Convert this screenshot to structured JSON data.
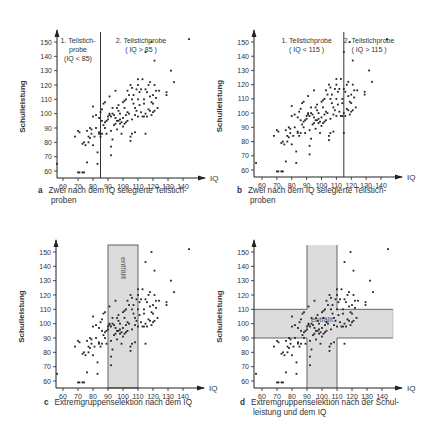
{
  "chart_data": [
    {
      "id": "a",
      "type": "scatter",
      "caption_letter": "a",
      "caption_line1": "Zwei nach dem IQ selegierte Teilstich-",
      "caption_line2": "proben",
      "xlabel": "IQ",
      "ylabel": "Schulleistung",
      "xticks": [
        60,
        70,
        80,
        90,
        100,
        110,
        120,
        130,
        140
      ],
      "yticks": [
        60,
        70,
        80,
        90,
        100,
        110,
        120,
        130,
        140,
        150
      ],
      "xlim": [
        55,
        145
      ],
      "ylim": [
        55,
        155
      ],
      "cut_x": 85,
      "annotations": [
        {
          "lines": [
            "1. Teilstich-",
            "probe",
            "(IQ < 85)"
          ],
          "iq": 70,
          "y": 149
        },
        {
          "lines": [
            "2. Teilstichprobe",
            "( IQ > 85 )"
          ],
          "iq": 112,
          "y": 149
        }
      ]
    },
    {
      "id": "b",
      "type": "scatter",
      "caption_letter": "b",
      "caption_line1": "Zwei nach dem IQ selegierte Teilstich-",
      "caption_line2": "proben",
      "xlabel": "IQ",
      "ylabel": "Schulleistung",
      "xticks": [
        60,
        70,
        80,
        90,
        100,
        110,
        120,
        130,
        140
      ],
      "yticks": [
        60,
        70,
        80,
        90,
        100,
        110,
        120,
        130,
        140,
        150
      ],
      "xlim": [
        55,
        145
      ],
      "ylim": [
        55,
        155
      ],
      "cut_x": 115,
      "annotations": [
        {
          "lines": [
            "1. Teilstichprobe",
            "( IQ < 115 )"
          ],
          "iq": 90,
          "y": 149
        },
        {
          "lines": [
            "2. Teilstichprobe",
            "( IQ > 115 )"
          ],
          "iq": 132,
          "y": 149
        }
      ]
    },
    {
      "id": "c",
      "type": "scatter",
      "caption_letter": "c",
      "caption_line1": "Extremgruppenselektion nach dem IQ",
      "caption_line2": "",
      "xlabel": "IQ",
      "ylabel": "Schulleistung",
      "xticks": [
        60,
        70,
        80,
        90,
        100,
        110,
        120,
        130,
        140
      ],
      "yticks": [
        60,
        70,
        80,
        90,
        100,
        110,
        120,
        130,
        140,
        150
      ],
      "xlim": [
        55,
        145
      ],
      "ylim": [
        55,
        155
      ],
      "band_x": [
        90,
        110
      ],
      "band_label": "entfällt"
    },
    {
      "id": "d",
      "type": "scatter",
      "caption_letter": "d",
      "caption_line1": "Extremgruppenselektion nach der Schul-",
      "caption_line2": "leistung und dem IQ",
      "xlabel": "IQ",
      "ylabel": "Schulleistung",
      "xticks": [
        60,
        70,
        80,
        90,
        100,
        110,
        120,
        130,
        140
      ],
      "yticks": [
        60,
        70,
        80,
        90,
        100,
        110,
        120,
        130,
        140,
        150
      ],
      "xlim": [
        55,
        145
      ],
      "ylim": [
        55,
        155
      ],
      "band_x": [
        90,
        110
      ],
      "band_y": [
        90,
        110
      ],
      "band_label": "entfällt"
    }
  ],
  "points": [
    [
      56,
      65
    ],
    [
      70,
      59
    ],
    [
      71,
      59
    ],
    [
      73,
      59
    ],
    [
      74,
      59
    ],
    [
      68,
      84
    ],
    [
      70,
      88
    ],
    [
      71,
      87
    ],
    [
      73,
      79
    ],
    [
      74,
      80
    ],
    [
      75,
      78
    ],
    [
      76,
      88
    ],
    [
      76,
      66
    ],
    [
      77,
      84
    ],
    [
      77,
      80
    ],
    [
      78,
      83
    ],
    [
      78,
      90
    ],
    [
      79,
      89
    ],
    [
      79,
      86
    ],
    [
      80,
      78
    ],
    [
      80,
      98
    ],
    [
      80,
      105
    ],
    [
      81,
      84
    ],
    [
      82,
      99
    ],
    [
      82,
      90
    ],
    [
      83,
      73
    ],
    [
      83,
      65
    ],
    [
      84,
      87
    ],
    [
      84,
      86
    ],
    [
      84,
      97
    ],
    [
      85,
      101
    ],
    [
      85,
      84
    ],
    [
      86,
      95
    ],
    [
      86,
      86
    ],
    [
      86,
      103
    ],
    [
      87,
      92
    ],
    [
      87,
      107
    ],
    [
      88,
      90
    ],
    [
      88,
      94
    ],
    [
      89,
      86
    ],
    [
      89,
      95
    ],
    [
      90,
      96
    ],
    [
      91,
      99
    ],
    [
      91,
      100
    ],
    [
      91,
      112
    ],
    [
      92,
      98
    ],
    [
      92,
      88
    ],
    [
      92,
      71
    ],
    [
      92,
      77
    ],
    [
      93,
      82
    ],
    [
      93,
      100
    ],
    [
      93,
      104
    ],
    [
      94,
      92
    ],
    [
      94,
      99
    ],
    [
      95,
      116
    ],
    [
      95,
      97
    ],
    [
      95,
      93
    ],
    [
      96,
      104
    ],
    [
      96,
      95
    ],
    [
      96,
      89
    ],
    [
      97,
      95
    ],
    [
      97,
      102
    ],
    [
      98,
      93
    ],
    [
      98,
      96
    ],
    [
      98,
      100
    ],
    [
      99,
      86
    ],
    [
      99,
      94
    ],
    [
      100,
      108
    ],
    [
      100,
      97
    ],
    [
      100,
      91
    ],
    [
      101,
      109
    ],
    [
      101,
      104
    ],
    [
      101,
      93
    ],
    [
      102,
      94
    ],
    [
      102,
      99
    ],
    [
      102,
      110
    ],
    [
      103,
      116
    ],
    [
      103,
      101
    ],
    [
      103,
      95
    ],
    [
      104,
      113
    ],
    [
      104,
      100
    ],
    [
      105,
      81
    ],
    [
      105,
      84
    ],
    [
      105,
      120
    ],
    [
      106,
      86
    ],
    [
      106,
      110
    ],
    [
      106,
      96
    ],
    [
      107,
      107
    ],
    [
      107,
      113
    ],
    [
      108,
      104
    ],
    [
      108,
      99
    ],
    [
      108,
      87
    ],
    [
      109,
      117
    ],
    [
      109,
      102
    ],
    [
      110,
      110
    ],
    [
      110,
      98
    ],
    [
      110,
      120
    ],
    [
      111,
      115
    ],
    [
      111,
      106
    ],
    [
      112,
      117
    ],
    [
      112,
      101
    ],
    [
      113,
      98
    ],
    [
      113,
      124
    ],
    [
      114,
      110
    ],
    [
      114,
      107
    ],
    [
      114,
      98
    ],
    [
      115,
      100
    ],
    [
      115,
      117
    ],
    [
      115,
      86
    ],
    [
      116,
      115
    ],
    [
      116,
      98
    ],
    [
      117,
      120
    ],
    [
      117,
      103
    ],
    [
      118,
      122
    ],
    [
      118,
      112
    ],
    [
      118,
      102
    ],
    [
      119,
      99
    ],
    [
      119,
      108
    ],
    [
      120,
      101
    ],
    [
      120,
      113
    ],
    [
      120,
      107
    ],
    [
      121,
      120
    ],
    [
      121,
      137
    ],
    [
      121,
      102
    ],
    [
      122,
      111
    ],
    [
      122,
      116
    ],
    [
      123,
      104
    ],
    [
      124,
      116
    ],
    [
      129,
      115
    ],
    [
      129,
      113
    ],
    [
      132,
      130
    ],
    [
      134,
      122
    ],
    [
      144,
      152
    ],
    [
      119,
      150
    ],
    [
      115,
      143
    ],
    [
      110,
      124
    ],
    [
      106,
      118
    ],
    [
      97,
      106
    ],
    [
      90,
      98
    ],
    [
      88,
      108
    ]
  ]
}
